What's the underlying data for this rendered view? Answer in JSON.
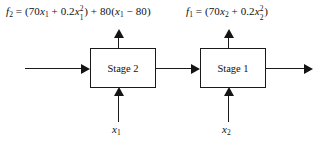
{
  "diagram": {
    "type": "serial-two-stage-block-diagram",
    "background_color": "#ffffff",
    "line_color": "#1a1a1a",
    "text_color": "#111111",
    "formulas": {
      "left": {
        "id": "f2",
        "plain_text": "f2 = (70x1 + 0.2x1^2) + 80(x1 - 80)",
        "lhs": "f",
        "lhs_sub": "2",
        "eq": "=",
        "open_paren": "(",
        "term1_coeff": "70",
        "term1_var": "x",
        "term1_sub": "1",
        "plus1": "+",
        "term2_coeff": "0.2",
        "term2_var": "x",
        "term2_sub": "1",
        "term2_sup": "2",
        "close_paren": ")",
        "plus2": "+",
        "term3_coeff": "80",
        "term3_open": "(",
        "term3_var": "x",
        "term3_sub": "1",
        "minus": "−",
        "term3_const": "80",
        "term3_close": ")"
      },
      "right": {
        "id": "f1",
        "plain_text": "f1 = (70x2 + 0.2x2^2)",
        "lhs": "f",
        "lhs_sub": "1",
        "eq": "=",
        "open_paren": "(",
        "term1_coeff": "70",
        "term1_var": "x",
        "term1_sub": "2",
        "plus1": "+",
        "term2_coeff": "0.2",
        "term2_var": "x",
        "term2_sub": "2",
        "term2_sup": "2",
        "close_paren": ")"
      }
    },
    "boxes": [
      {
        "id": "stage-2",
        "label": "Stage 2"
      },
      {
        "id": "stage-1",
        "label": "Stage 1"
      }
    ],
    "input_labels": [
      {
        "id": "x1",
        "var": "x",
        "sub": "1"
      },
      {
        "id": "x2",
        "var": "x",
        "sub": "2"
      }
    ],
    "arrows": {
      "input_flow": "arrow-right-into-stage-2",
      "interstage_flow": "arrow-right-stage2-to-stage1",
      "output_flow": "arrow-right-out-of-stage-1",
      "stage2_output_up": "arrow-up-from-stage-2",
      "stage1_output_up": "arrow-up-from-stage-1",
      "stage2_input_up": "arrow-up-into-stage-2",
      "stage1_input_up": "arrow-up-into-stage-1"
    }
  }
}
